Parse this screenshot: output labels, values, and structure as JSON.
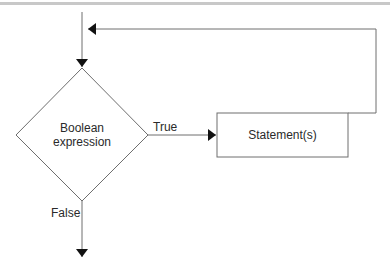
{
  "diagram": {
    "type": "flowchart",
    "nodes": [
      {
        "id": "condition",
        "shape": "diamond",
        "line1": "Boolean",
        "line2": "expression"
      },
      {
        "id": "statements",
        "shape": "rectangle",
        "label": "Statement(s)"
      }
    ],
    "edges": [
      {
        "from": "entry",
        "to": "condition",
        "label": ""
      },
      {
        "from": "condition",
        "to": "statements",
        "label": "True"
      },
      {
        "from": "statements",
        "to": "condition",
        "label": ""
      },
      {
        "from": "condition",
        "to": "exit",
        "label": "False"
      }
    ],
    "labels": {
      "condition_line1": "Boolean",
      "condition_line2": "expression",
      "statement": "Statement(s)",
      "true_branch": "True",
      "false_branch": "False"
    },
    "colors": {
      "stroke": "#6e6e6e",
      "arrowhead": "#111111",
      "text": "#2a2a2a",
      "top_rule": "#c8c8c8"
    }
  }
}
